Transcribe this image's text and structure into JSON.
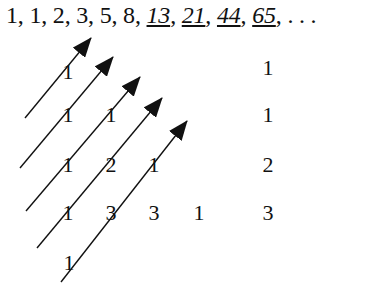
{
  "sequence": {
    "terms": [
      "1",
      "1",
      "2",
      "3",
      "5",
      "8",
      "13",
      "21",
      "44",
      "65"
    ],
    "underlined_italic_from_index": 6,
    "ellipsis": ". . ."
  },
  "triangle": {
    "rows": [
      [
        "1"
      ],
      [
        "1",
        "1"
      ],
      [
        "1",
        "2",
        "1"
      ],
      [
        "1",
        "3",
        "3",
        "1"
      ],
      [
        "1"
      ]
    ]
  },
  "diagonal_sums": [
    "1",
    "1",
    "2",
    "3"
  ],
  "arrows": [
    {
      "from": [
        25,
        118
      ],
      "to": [
        91,
        38
      ]
    },
    {
      "from": [
        20,
        168
      ],
      "to": [
        113,
        57
      ]
    },
    {
      "from": [
        26,
        211
      ],
      "to": [
        140,
        77
      ]
    },
    {
      "from": [
        37,
        248
      ],
      "to": [
        162,
        98
      ]
    },
    {
      "from": [
        61,
        282
      ],
      "to": [
        187,
        121
      ]
    }
  ],
  "colors": {
    "ink": "#111111",
    "background": "#ffffff"
  }
}
